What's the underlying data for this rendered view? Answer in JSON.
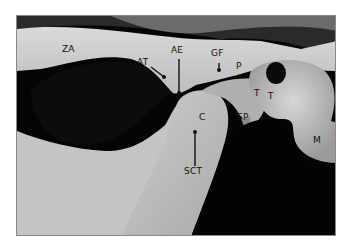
{
  "figure": {
    "labels": [
      {
        "id": "ZA",
        "text": "ZA",
        "x": 62,
        "y": 45
      },
      {
        "id": "AT",
        "text": "AT",
        "x": 137,
        "y": 60
      },
      {
        "id": "AE",
        "text": "AE",
        "x": 171,
        "y": 47
      },
      {
        "id": "GF",
        "text": "GF",
        "x": 211,
        "y": 49
      },
      {
        "id": "P",
        "text": "P",
        "x": 236,
        "y": 62
      },
      {
        "id": "T",
        "text": "T",
        "x": 254,
        "y": 89
      },
      {
        "id": "Tr",
        "text": "T",
        "x": 268,
        "y": 92
      },
      {
        "id": "SP",
        "text": "SP",
        "x": 237,
        "y": 112
      },
      {
        "id": "C",
        "text": "C",
        "x": 199,
        "y": 113
      },
      {
        "id": "SCT",
        "text": "SCT",
        "x": 184,
        "y": 165
      },
      {
        "id": "M",
        "text": "M",
        "x": 313,
        "y": 136
      }
    ]
  }
}
